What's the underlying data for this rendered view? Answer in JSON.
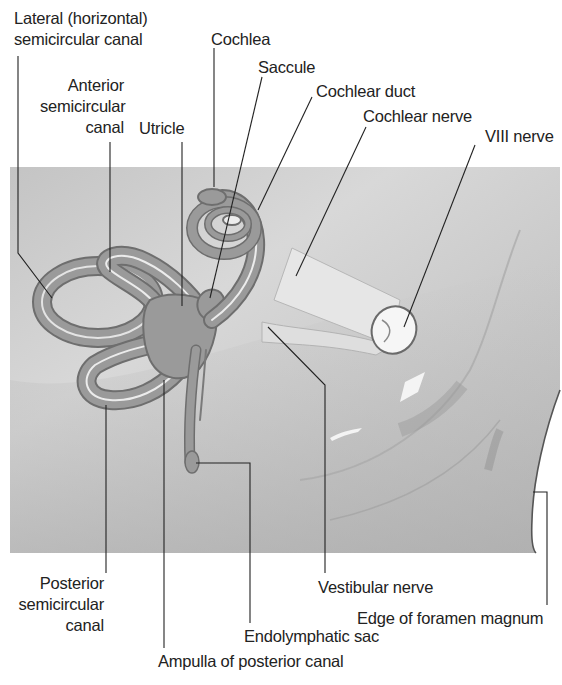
{
  "figure": {
    "colors": {
      "background": "#ffffff",
      "panel_base": "#c9c9c9",
      "panel_light": "#dcdcdc",
      "labyrinth_fill": "#9a9a9a",
      "labyrinth_outline": "#6e6e6e",
      "labyrinth_inner_highlight": "#ececec",
      "nerve_fill": "#e6e6e6",
      "leader_line": "#222222",
      "text": "#222222"
    }
  },
  "labels": {
    "lateral_canal": "Lateral (horizontal)\nsemicircular canal",
    "anterior_canal": "Anterior\nsemicircular\ncanal",
    "utricle": "Utricle",
    "cochlea": "Cochlea",
    "saccule": "Saccule",
    "cochlear_duct": "Cochlear duct",
    "cochlear_nerve": "Cochlear nerve",
    "viii_nerve": "VIII nerve",
    "posterior_canal": "Posterior\nsemicircular\ncanal",
    "ampulla_posterior": "Ampulla of posterior canal",
    "endolymphatic_sac": "Endolymphatic sac",
    "vestibular_nerve": "Vestibular nerve",
    "foramen_magnum": "Edge of foramen magnum"
  }
}
